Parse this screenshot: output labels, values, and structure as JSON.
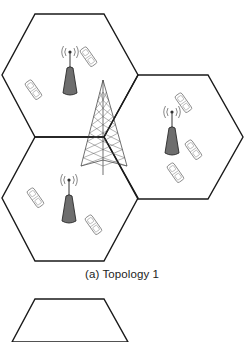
{
  "figure": {
    "caption": "(a) Topology 1",
    "caption_top": 268,
    "colors": {
      "hex_stroke": "#1a1a1a",
      "base_station_fill": "#6e6e6e",
      "phone_stroke": "#8a8a8a",
      "tower_stroke": "#333333"
    },
    "cells": [
      {
        "id": "cell-top-left",
        "points": "35,14 104,14 138,75 104,137 35,137 2,75"
      },
      {
        "id": "cell-right",
        "points": "138,75 208,75 243,137 208,199 138,199 104,137"
      },
      {
        "id": "cell-bottom-left",
        "points": "35,137 104,137 138,198 104,261 35,261 2,198"
      },
      {
        "id": "cell-second-topology-partial",
        "points": "12,342 35,299 104,299 128,342"
      }
    ],
    "base_stations": [
      {
        "id": "bs-top-left",
        "x": 70,
        "y": 52
      },
      {
        "id": "bs-right",
        "x": 172,
        "y": 112
      },
      {
        "id": "bs-bottom-left",
        "x": 69,
        "y": 180
      }
    ],
    "phones": [
      {
        "id": "ue-1",
        "x": 88,
        "y": 57,
        "rot": -35
      },
      {
        "id": "ue-2",
        "x": 33,
        "y": 90,
        "rot": -35
      },
      {
        "id": "ue-3",
        "x": 183,
        "y": 103,
        "rot": -35
      },
      {
        "id": "ue-4",
        "x": 193,
        "y": 150,
        "rot": -35
      },
      {
        "id": "ue-5",
        "x": 175,
        "y": 173,
        "rot": -35
      },
      {
        "id": "ue-6",
        "x": 35,
        "y": 198,
        "rot": -35
      },
      {
        "id": "ue-7",
        "x": 93,
        "y": 225,
        "rot": -35
      }
    ],
    "tower": {
      "tip_x": 103,
      "tip_y": 80,
      "base_left": 81,
      "base_right": 127,
      "base_y": 166,
      "foot_y": 175
    }
  }
}
